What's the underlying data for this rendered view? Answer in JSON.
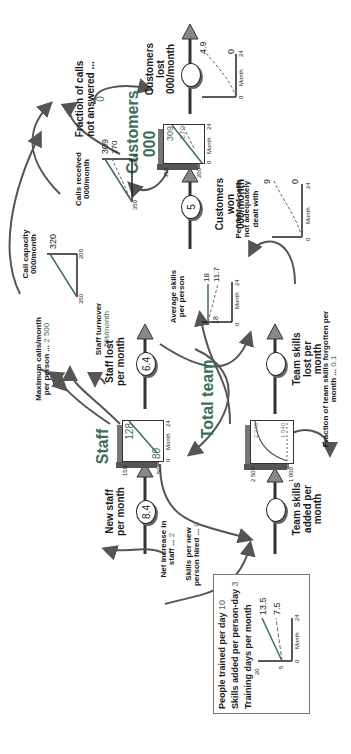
{
  "diagram": {
    "orientation": "rotated 90° counter-clockwise",
    "stocks": {
      "customers": {
        "title": "Customers 000",
        "y_top": "350",
        "y_bottom": "200",
        "x_left": "0",
        "x_right": "24",
        "x_label": "Month",
        "series_solid_end": "309",
        "series_dashed_end": "270"
      },
      "staff": {
        "title": "Staff",
        "y_top": "150",
        "y_bottom": "50",
        "x_left": "0",
        "x_right": "24",
        "x_label": "Month",
        "series_solid_end": "128",
        "series_start": "80"
      },
      "team_skills": {
        "title": "Total team",
        "y_top": "2 500",
        "y_bottom": "1 000",
        "series_curve_end": "2 340",
        "series_dashed_end": "1 540"
      }
    },
    "flows": {
      "customers_won": {
        "label": "Customers won 000/month",
        "value": "5"
      },
      "customers_lost": {
        "label": "Customers lost 000/month",
        "value": ""
      },
      "new_staff": {
        "label": "New staff per month",
        "value": "8.4"
      },
      "staff_lost": {
        "label": "Staff lost per month",
        "value": "6.4"
      },
      "team_skills_added": {
        "label": "Team skills added per month",
        "value": ""
      },
      "team_skills_lost": {
        "label": "Team skills lost per month",
        "value": ""
      }
    },
    "graphs": {
      "customers_lost_graph": {
        "y_top": "5",
        "x_left": "0",
        "x_right": "24",
        "x_label": "Month",
        "curve_end": "4.9",
        "zero": "0"
      },
      "percent_not_dealt": {
        "title": "Percent of calls not adequately dealt with",
        "y_top": "10",
        "x_left": "0",
        "x_right": "24",
        "x_label": "Month",
        "curve_end": "9",
        "zero": "0"
      },
      "calls_received": {
        "title": "Calls received 000/month",
        "y_top": "350",
        "y_bottom": "200",
        "solid_end": "309",
        "dashed_end": "270"
      },
      "call_capacity": {
        "title": "Call capacity 000/month",
        "y_top": "350",
        "y_bottom": "200",
        "solid_end": "320"
      },
      "average_skills": {
        "title": "Average skills per person",
        "y_top": "20",
        "x_left": "0",
        "x_right": "24",
        "x_label": "Month",
        "solid_end": "18",
        "dashed_end": "11.7",
        "start": "18"
      },
      "training": {
        "y_top": "20",
        "y_mid": "5",
        "x_left": "0",
        "x_right": "24",
        "x_label": "Month",
        "solid_end": "13.5",
        "dashed_end": "7.5"
      }
    },
    "parameters": {
      "fraction_not_answered": {
        "label": "Fraction of calls not answered ...",
        "value": "0"
      },
      "max_calls": {
        "label": "Maximum calls/month per person ...",
        "value": "2 500"
      },
      "staff_turnover": {
        "label": "Staff turnover",
        "value": "5%/month"
      },
      "net_increase": {
        "label": "Net increase in staff ...",
        "value": "2"
      },
      "skills_per_new": {
        "label": "Skills per new person hired ...",
        "value": "0"
      },
      "fraction_forgotten": {
        "label": "Fraction of team skills forgotten per month ...",
        "value": "0.1"
      },
      "people_trained": {
        "label": "People trained per day",
        "value": "10"
      },
      "skills_added_per_day": {
        "label": "Skills added per person-day",
        "value": "3"
      },
      "training_days": {
        "label": "Training days per month",
        "value": ""
      }
    },
    "colors": {
      "accent_green": "#3c6e5a",
      "line": "#333333",
      "arrow": "#555555",
      "dashed": "#666666"
    }
  }
}
